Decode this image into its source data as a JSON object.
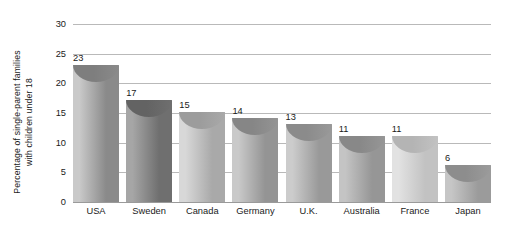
{
  "chart_data": {
    "type": "bar",
    "title": "",
    "subtitle": "",
    "xlabel": "",
    "ylabel_lines": [
      "Percentage of single-parent families",
      "with children under 18"
    ],
    "ylabel": "Percentage of single-parent families with children under 18",
    "categories": [
      "USA",
      "Sweden",
      "Canada",
      "Germany",
      "U.K.",
      "Australia",
      "France",
      "Japan"
    ],
    "values": [
      23,
      17,
      15,
      14,
      13,
      11,
      11,
      6
    ],
    "value_labels": [
      "23",
      "17",
      "15",
      "14",
      "13",
      "11",
      "11",
      "6"
    ],
    "ylim": [
      0,
      30
    ],
    "ytick_values": [
      0,
      5,
      10,
      15,
      20,
      25,
      30
    ],
    "ytick_labels": [
      "0",
      "5",
      "10",
      "15",
      "20",
      "25",
      "30"
    ],
    "grid": true,
    "legend": false,
    "legend_position": "none",
    "bar_style": "3d-cylinder",
    "bar_colors_light": [
      "#c9c9c9",
      "#a6a6a6",
      "#d8d8d8",
      "#c9c9c9",
      "#cccccc",
      "#c4c4c4",
      "#e2e2e2",
      "#c6c6c6"
    ],
    "bar_colors_dark": [
      "#8a8a8a",
      "#6f6f6f",
      "#a9a9a9",
      "#949494",
      "#999999",
      "#969696",
      "#c2c2c2",
      "#9b9b9b"
    ],
    "cap_colors": [
      "#7e7e7e",
      "#636363",
      "#9c9c9c",
      "#868686",
      "#8b8b8b",
      "#888888",
      "#b4b4b4",
      "#8d8d8d"
    ],
    "grid_color": "#b9b9b9",
    "axis_color": "#9a9a9a",
    "text_color": "#1a1a1a",
    "background": "#ffffff"
  }
}
